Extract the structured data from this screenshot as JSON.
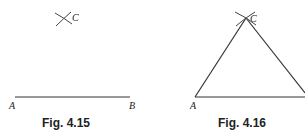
{
  "figures": [
    {
      "caption": "Fig. 4.15",
      "labels": {
        "a": "A",
        "b": "B",
        "c": "C"
      },
      "description": "Line segment AB with intersecting arcs marking point C above"
    },
    {
      "caption": "Fig. 4.16",
      "labels": {
        "a": "A",
        "c": "C"
      },
      "description": "Triangle ABC constructed by joining A and B to point C"
    }
  ],
  "colors": {
    "stroke": "#333333",
    "text": "#222222",
    "background": "#ffffff"
  }
}
